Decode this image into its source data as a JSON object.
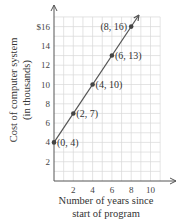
{
  "chart_data": {
    "type": "line",
    "title": "",
    "xlabel": "Number of years since start of program",
    "xlabel_lines": [
      "Number of years since",
      "start of program"
    ],
    "ylabel": "Cost of computer system (in thousands)",
    "ylabel_lines": [
      "Cost of computer system",
      "(in thousands)"
    ],
    "x_ticks": [
      "2",
      "4",
      "6",
      "8",
      "10"
    ],
    "y_ticks": [
      "2",
      "4",
      "6",
      "8",
      "10",
      "12",
      "14",
      "$16"
    ],
    "xlim": [
      0,
      11
    ],
    "ylim": [
      0,
      17
    ],
    "grid": true,
    "legend": null,
    "points": [
      {
        "x": 0,
        "y": 4,
        "label": "(0, 4)"
      },
      {
        "x": 2,
        "y": 7,
        "label": "(2, 7)"
      },
      {
        "x": 4,
        "y": 10,
        "label": "(4, 10)"
      },
      {
        "x": 6,
        "y": 13,
        "label": "(6, 13)"
      },
      {
        "x": 8,
        "y": 16,
        "label": "(8, 16)"
      }
    ],
    "series": [
      {
        "name": "Cost",
        "x": [
          0,
          2,
          4,
          6,
          8
        ],
        "values": [
          4,
          7,
          10,
          13,
          16
        ]
      }
    ]
  }
}
